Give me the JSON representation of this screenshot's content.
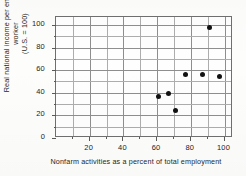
{
  "chart_data": {
    "type": "scatter",
    "title": "",
    "xlabel": "Nonfarm activities as a percent of total employment",
    "ylabel_line1": "Real national income per employed worker",
    "ylabel_line2": "(U.S. = 100)",
    "xlim": [
      0,
      105
    ],
    "ylim": [
      0,
      107
    ],
    "grid": true,
    "grid_step_x": 10,
    "grid_step_y": 10,
    "legend": "none",
    "xticks": [
      20,
      40,
      60,
      80,
      100
    ],
    "xtick_labels": [
      "20",
      "40",
      "60",
      "80",
      "100"
    ],
    "yticks": [
      0,
      20,
      40,
      60,
      80,
      100
    ],
    "ytick_labels": [
      "0",
      "20",
      "40",
      "60",
      "80",
      "100"
    ],
    "x": [
      61,
      67,
      71,
      77,
      87,
      91,
      97
    ],
    "y": [
      37,
      39,
      24,
      56,
      56,
      98,
      54
    ],
    "points": [
      {
        "x": 61,
        "y": 37
      },
      {
        "x": 67,
        "y": 39
      },
      {
        "x": 71,
        "y": 24
      },
      {
        "x": 77,
        "y": 56
      },
      {
        "x": 87,
        "y": 56
      },
      {
        "x": 91,
        "y": 98
      },
      {
        "x": 97,
        "y": 54
      }
    ],
    "marker": "filled-circle",
    "marker_color": "#111111"
  },
  "colors": {
    "background": "#fdfdfc",
    "plot_background": "#fefefe",
    "grid": "#adadad",
    "axis": "#6f6f6f",
    "text": "#232323",
    "marker": "#111111"
  }
}
